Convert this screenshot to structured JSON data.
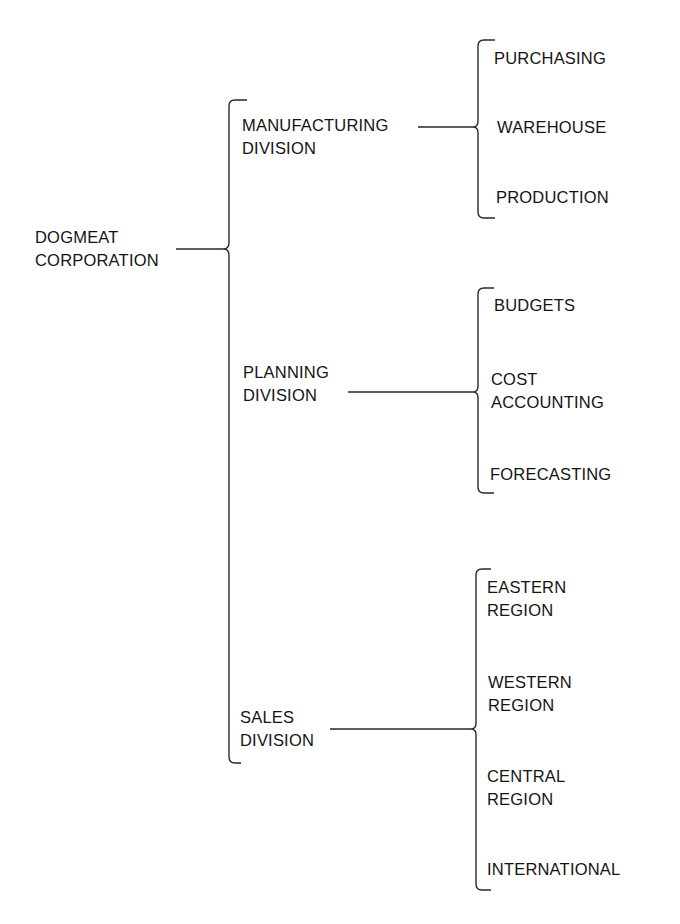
{
  "diagram": {
    "type": "org-chart-brackets",
    "root": {
      "lines": [
        "DOGMEAT",
        "CORPORATION"
      ]
    },
    "divisions": [
      {
        "lines": [
          "MANUFACTURING",
          "DIVISION"
        ],
        "departments": [
          {
            "lines": [
              "PURCHASING"
            ]
          },
          {
            "lines": [
              "WAREHOUSE"
            ]
          },
          {
            "lines": [
              "PRODUCTION"
            ]
          }
        ]
      },
      {
        "lines": [
          "PLANNING",
          "DIVISION"
        ],
        "departments": [
          {
            "lines": [
              "BUDGETS"
            ]
          },
          {
            "lines": [
              "COST",
              "ACCOUNTING"
            ]
          },
          {
            "lines": [
              "FORECASTING"
            ]
          }
        ]
      },
      {
        "lines": [
          "SALES",
          "DIVISION"
        ],
        "departments": [
          {
            "lines": [
              "EASTERN",
              "REGION"
            ]
          },
          {
            "lines": [
              "WESTERN",
              "REGION"
            ]
          },
          {
            "lines": [
              "CENTRAL",
              "REGION"
            ]
          },
          {
            "lines": [
              "INTERNATIONAL"
            ]
          }
        ]
      }
    ]
  },
  "colors": {
    "background": "#ffffff",
    "ink": "#141414"
  }
}
